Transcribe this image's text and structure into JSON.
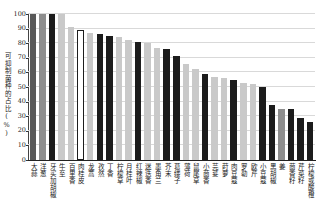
{
  "chart_data": {
    "type": "bar",
    "title": "",
    "xlabel": "",
    "ylabel": "可抑制菌种的占比(%)",
    "ylim": [
      0,
      100
    ],
    "yticks": [
      0,
      10,
      20,
      30,
      40,
      50,
      60,
      70,
      80,
      90,
      100
    ],
    "grid": true,
    "legend": "none",
    "categories": [
      "大蒜",
      "洋葱",
      "牙买加胡椒",
      "牛至",
      "百里香",
      "肉桂皮",
      "龙蒿",
      "孜然",
      "丁香",
      "柠檬草",
      "月桂叶",
      "红辣椒",
      "迷迭香",
      "墨角兰",
      "芥末",
      "葛缕子",
      "薄荷",
      "鼠尾草",
      "小茴香",
      "芫荽",
      "莳萝",
      "肉豆蔻",
      "罗勒",
      "欧芹",
      "小豆蔻",
      "黑胡椒",
      "姜",
      "茴香籽",
      "芹菜籽",
      "柠檬或酸橙"
    ],
    "values": [
      100,
      100,
      100,
      100,
      91,
      89,
      87,
      86,
      85,
      84,
      82,
      81,
      80,
      77,
      76,
      71,
      66,
      62,
      59,
      57,
      56,
      55,
      53,
      52,
      50,
      38,
      35,
      35,
      29,
      26
    ],
    "bar_color_keys": [
      "dark_gray",
      "mid_gray",
      "black",
      "light_gray",
      "light_gray",
      "white",
      "light_gray",
      "black",
      "black",
      "light_gray",
      "light_gray",
      "black",
      "light_gray",
      "light_gray",
      "black",
      "black",
      "light_gray",
      "light_gray",
      "black",
      "light_gray",
      "light_gray",
      "black",
      "light_gray",
      "light_gray",
      "black",
      "black",
      "mid_gray",
      "black",
      "black",
      "black"
    ],
    "palette": {
      "black": "#1c1c1c",
      "dark_gray": "#595959",
      "mid_gray": "#8e8e8e",
      "light_gray": "#c9c9c9",
      "white": "#ffffff"
    },
    "gridline_color": "#d9d9d9",
    "axis_color": "#222222",
    "background_color": "#ffffff"
  }
}
